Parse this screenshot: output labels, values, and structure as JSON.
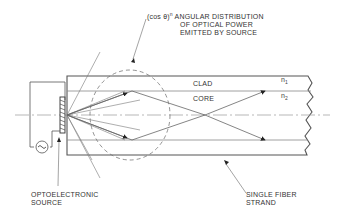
{
  "diagram": {
    "labels": {
      "angular_prefix": "(cos θ)",
      "angular_exponent": "n",
      "angular_line1": "ANGULAR DISTRIBUTION",
      "angular_line2": "OF OPTICAL POWER",
      "angular_line3": "EMITTED BY SOURCE",
      "clad": "CLAD",
      "core": "CORE",
      "n1_base": "n",
      "n1_sub": "1",
      "n2_base": "n",
      "n2_sub": "2",
      "source_line1": "OPTOELECTRONIC",
      "source_line2": "SOURCE",
      "fiber_line1": "SINGLE FIBER",
      "fiber_line2": "STRAND"
    },
    "icons": {
      "ac_source": "~"
    },
    "colors": {
      "line": "#555555",
      "text": "#333333",
      "background": "#ffffff"
    }
  }
}
